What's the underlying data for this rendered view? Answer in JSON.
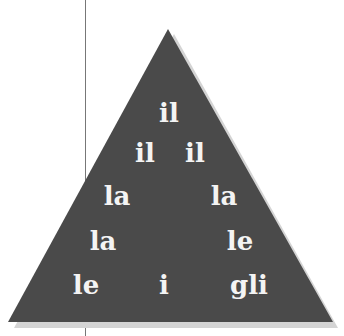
{
  "triangle": {
    "fill_color": "#4a4a4a",
    "shadow_color": "#d2d2d2",
    "rows": [
      [
        "il"
      ],
      [
        "il",
        "il"
      ],
      [
        "la",
        "la"
      ],
      [
        "la",
        "le"
      ],
      [
        "le",
        "i",
        "gli"
      ]
    ]
  }
}
